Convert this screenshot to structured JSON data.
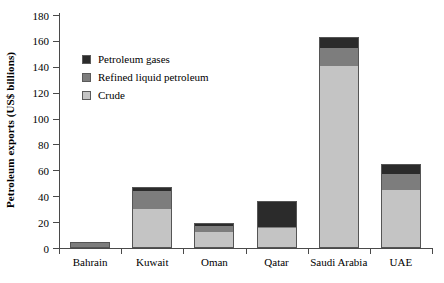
{
  "chart_data": {
    "type": "bar",
    "subtype": "stacked",
    "title": "",
    "xlabel": "",
    "ylabel": "Petroleum exports (US$ billions)",
    "ylim": [
      0,
      180
    ],
    "ytick_labels": [
      "0",
      "20",
      "40",
      "60",
      "80",
      "100",
      "120",
      "140",
      "160",
      "180"
    ],
    "ytick_values": [
      0,
      20,
      40,
      60,
      80,
      100,
      120,
      140,
      160,
      180
    ],
    "grid": false,
    "legend_position": "upper-left-inside",
    "categories": [
      "Bahrain",
      "Kuwait",
      "Oman",
      "Qatar",
      "Saudi Arabia",
      "UAE"
    ],
    "series": [
      {
        "name": "Crude",
        "color": "#c4c4c4",
        "values": [
          0,
          30,
          13,
          15,
          141,
          45
        ]
      },
      {
        "name": "Refined liquid petroleum",
        "color": "#7d7d7d",
        "values": [
          5,
          15,
          5,
          1,
          14,
          13
        ]
      },
      {
        "name": "Petroleum gases",
        "color": "#2b2b2b",
        "values": [
          0,
          2,
          1,
          20,
          8,
          7
        ]
      }
    ],
    "totals": [
      5,
      47,
      19,
      36,
      163,
      65
    ]
  },
  "legend": {
    "items": [
      {
        "label": "Petroleum gases",
        "color": "#2b2b2b"
      },
      {
        "label": "Refined liquid petroleum",
        "color": "#7d7d7d"
      },
      {
        "label": "Crude",
        "color": "#c4c4c4"
      }
    ]
  }
}
